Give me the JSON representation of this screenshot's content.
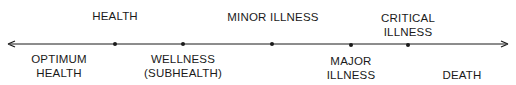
{
  "diagram": {
    "axis": {
      "direction": "bidirectional",
      "color": "#1a1a1a"
    },
    "points": [
      {
        "x": 115,
        "label_above": "HEALTH"
      },
      {
        "x": 183,
        "label_below": "WELLNESS\n(SUBHEALTH)"
      },
      {
        "x": 272,
        "label_above": "MINOR ILLNESS"
      },
      {
        "x": 351,
        "label_below": "MAJOR\nILLNESS"
      },
      {
        "x": 408,
        "label_above": "CRITICAL\nILLNESS"
      }
    ],
    "endpoints": {
      "left": "OPTIMUM\nHEALTH",
      "right": "DEATH"
    },
    "labels": {
      "health": "HEALTH",
      "minor_illness": "MINOR ILLNESS",
      "critical_1": "CRITICAL",
      "critical_2": "ILLNESS",
      "optimum_1": "OPTIMUM",
      "optimum_2": "HEALTH",
      "wellness_1": "WELLNESS",
      "wellness_2": "(SUBHEALTH)",
      "major_1": "MAJOR",
      "major_2": "ILLNESS",
      "death": "DEATH"
    }
  }
}
